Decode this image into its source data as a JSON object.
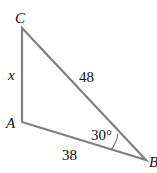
{
  "diagram": {
    "type": "triangle",
    "vertices": [
      {
        "name": "C",
        "label": "C"
      },
      {
        "name": "A",
        "label": "A"
      },
      {
        "name": "B",
        "label": "B"
      }
    ],
    "sides": {
      "CA": "x",
      "CB": "48",
      "AB": "38"
    },
    "angle_B": "30°",
    "colors": {
      "stroke": "#808080",
      "text": "#111111"
    }
  }
}
